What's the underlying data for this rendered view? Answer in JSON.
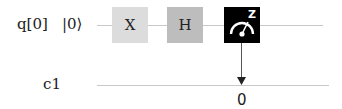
{
  "circuit": {
    "qubits": [
      {
        "label": "q[0]",
        "initial_state": "|0⟩"
      }
    ],
    "classical_registers": [
      {
        "label": "c1"
      }
    ],
    "gates": [
      {
        "name": "X",
        "type": "pauli-x",
        "color": "#dcdcdc"
      },
      {
        "name": "H",
        "type": "hadamard",
        "color": "#bdbdbd"
      },
      {
        "name": "measure",
        "type": "measurement",
        "basis": "Z",
        "color": "#000000"
      }
    ],
    "measurement_output": {
      "bit": "0"
    }
  }
}
